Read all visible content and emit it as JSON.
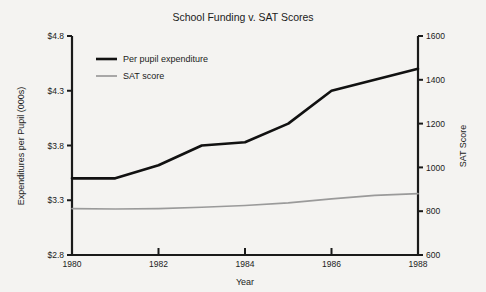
{
  "chart_data": {
    "type": "line",
    "title": "School Funding v. SAT Scores",
    "xlabel": "Year",
    "ylabel": "Expenditures per Pupil (000s)",
    "y2label": "SAT Score",
    "grid": false,
    "legend_position": "top-left-inside",
    "x": [
      1980,
      1981,
      1982,
      1983,
      1984,
      1985,
      1986,
      1987,
      1988
    ],
    "xlim": [
      1980,
      1988
    ],
    "xticks": [
      1980,
      1982,
      1984,
      1986,
      1988
    ],
    "xticklabels": [
      "1980",
      "1982",
      "1984",
      "1986",
      "1988"
    ],
    "ylim": [
      2.8,
      4.8
    ],
    "yticks": [
      2.8,
      3.3,
      3.8,
      4.3,
      4.8
    ],
    "yticklabels": [
      "$2.8",
      "$3.3",
      "$3.8",
      "$4.3",
      "$4.8"
    ],
    "y2lim": [
      600,
      1600
    ],
    "y2ticks": [
      600,
      800,
      1000,
      1200,
      1400,
      1600
    ],
    "y2ticklabels": [
      "600",
      "800",
      "1000",
      "1200",
      "1400",
      "1600"
    ],
    "series": [
      {
        "name": "Per pupil expenditure",
        "axis": "left",
        "color": "#111111",
        "values": [
          3.5,
          3.5,
          3.62,
          3.8,
          3.83,
          4.0,
          4.3,
          4.4,
          4.5
        ]
      },
      {
        "name": "SAT score",
        "axis": "right",
        "color": "#9a9a9a",
        "values": [
          812,
          810,
          812,
          818,
          826,
          838,
          856,
          872,
          880
        ]
      }
    ]
  },
  "legend": {
    "items": [
      {
        "label": "Per pupil expenditure"
      },
      {
        "label": "SAT score"
      }
    ]
  },
  "colors": {
    "expenditure": "#111111",
    "sat": "#9a9a9a",
    "axis": "#1a1a1a",
    "background": "#f4f3f1"
  }
}
